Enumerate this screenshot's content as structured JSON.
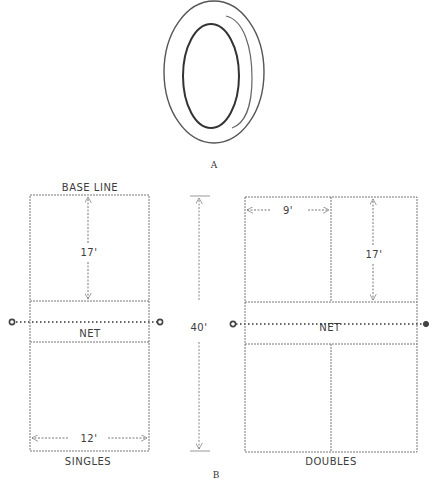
{
  "figure_a": {
    "label": "A",
    "object": "deck-tennis-ring"
  },
  "figure_b": {
    "label": "B",
    "singles": {
      "title": "SINGLES",
      "baseline_label": "BASE LINE",
      "depth_label": "17'",
      "width_label": "12'",
      "net_label": "NET"
    },
    "overall_length_label": "40'",
    "doubles": {
      "title": "DOUBLES",
      "half_width_label": "9'",
      "depth_label": "17'",
      "net_label": "NET"
    }
  },
  "colors": {
    "line": "#6a6a6a",
    "text": "#3c3c3c",
    "background": "#ffffff"
  }
}
